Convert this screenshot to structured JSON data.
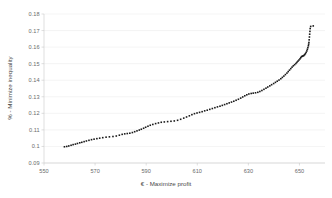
{
  "chart_data": {
    "type": "scatter",
    "title": "",
    "xlabel": "€ - Maximize profit",
    "ylabel": "% - Minimize inequality",
    "xlim": [
      550,
      660
    ],
    "ylim": [
      0.09,
      0.18
    ],
    "xticks": [
      550,
      570,
      590,
      610,
      630,
      650
    ],
    "yticks": [
      0.09,
      0.1,
      0.11,
      0.12,
      0.13,
      0.14,
      0.15,
      0.16,
      0.17,
      0.18
    ],
    "xtick_labels": [
      "550",
      "570",
      "590",
      "610",
      "630",
      "650"
    ],
    "ytick_labels": [
      "0.09",
      "0.1",
      "0.11",
      "0.12",
      "0.13",
      "0.14",
      "0.15",
      "0.16",
      "0.17",
      "0.18"
    ],
    "grid": "horizontal",
    "legend": "none",
    "marker_color": "#1a1a1a",
    "marker_size": 1.6,
    "series": [
      {
        "name": "Pareto front",
        "points": [
          [
            558.0,
            0.0998
          ],
          [
            558.9,
            0.1
          ],
          [
            559.7,
            0.1003
          ],
          [
            560.6,
            0.1007
          ],
          [
            561.4,
            0.1011
          ],
          [
            562.3,
            0.1014
          ],
          [
            563.1,
            0.1018
          ],
          [
            564.0,
            0.1022
          ],
          [
            564.8,
            0.1025
          ],
          [
            565.7,
            0.1029
          ],
          [
            566.6,
            0.1033
          ],
          [
            567.6,
            0.1037
          ],
          [
            568.6,
            0.1041
          ],
          [
            569.6,
            0.1044
          ],
          [
            570.7,
            0.1047
          ],
          [
            571.8,
            0.105
          ],
          [
            573.0,
            0.1053
          ],
          [
            574.3,
            0.1056
          ],
          [
            575.6,
            0.1058
          ],
          [
            577.0,
            0.106
          ],
          [
            578.3,
            0.1063
          ],
          [
            579.5,
            0.1068
          ],
          [
            580.6,
            0.1073
          ],
          [
            581.6,
            0.1076
          ],
          [
            582.6,
            0.1078
          ],
          [
            583.6,
            0.108
          ],
          [
            584.6,
            0.1084
          ],
          [
            585.5,
            0.1089
          ],
          [
            586.4,
            0.1094
          ],
          [
            587.3,
            0.1099
          ],
          [
            588.1,
            0.1104
          ],
          [
            589.0,
            0.111
          ],
          [
            589.8,
            0.1116
          ],
          [
            590.7,
            0.1122
          ],
          [
            591.6,
            0.1128
          ],
          [
            592.6,
            0.1133
          ],
          [
            593.7,
            0.1138
          ],
          [
            594.8,
            0.1142
          ],
          [
            595.9,
            0.1146
          ],
          [
            597.1,
            0.1148
          ],
          [
            598.4,
            0.115
          ],
          [
            599.7,
            0.1152
          ],
          [
            601.0,
            0.1154
          ],
          [
            602.3,
            0.1158
          ],
          [
            603.5,
            0.1164
          ],
          [
            604.7,
            0.1171
          ],
          [
            605.8,
            0.1178
          ],
          [
            606.9,
            0.1185
          ],
          [
            607.9,
            0.1192
          ],
          [
            608.9,
            0.1198
          ],
          [
            609.9,
            0.1202
          ],
          [
            610.9,
            0.1206
          ],
          [
            611.9,
            0.121
          ],
          [
            612.9,
            0.1215
          ],
          [
            613.9,
            0.1219
          ],
          [
            614.9,
            0.1224
          ],
          [
            615.9,
            0.1229
          ],
          [
            616.9,
            0.1234
          ],
          [
            617.9,
            0.1239
          ],
          [
            618.9,
            0.1243
          ],
          [
            619.8,
            0.1248
          ],
          [
            620.7,
            0.1253
          ],
          [
            621.6,
            0.1258
          ],
          [
            622.5,
            0.1263
          ],
          [
            623.4,
            0.1268
          ],
          [
            624.3,
            0.1273
          ],
          [
            625.2,
            0.1279
          ],
          [
            626.1,
            0.1285
          ],
          [
            627.0,
            0.1292
          ],
          [
            627.8,
            0.1299
          ],
          [
            628.6,
            0.1306
          ],
          [
            629.4,
            0.1312
          ],
          [
            630.2,
            0.1317
          ],
          [
            631.1,
            0.132
          ],
          [
            631.9,
            0.1322
          ],
          [
            632.8,
            0.1324
          ],
          [
            633.7,
            0.1327
          ],
          [
            634.5,
            0.1332
          ],
          [
            635.3,
            0.1338
          ],
          [
            636.1,
            0.1345
          ],
          [
            636.9,
            0.1352
          ],
          [
            637.6,
            0.1359
          ],
          [
            638.4,
            0.1366
          ],
          [
            639.1,
            0.1373
          ],
          [
            639.9,
            0.138
          ],
          [
            640.6,
            0.1387
          ],
          [
            641.3,
            0.1394
          ],
          [
            642.0,
            0.1401
          ],
          [
            642.7,
            0.1409
          ],
          [
            643.3,
            0.1417
          ],
          [
            643.9,
            0.1425
          ],
          [
            644.5,
            0.1434
          ],
          [
            645.1,
            0.1443
          ],
          [
            645.6,
            0.1452
          ],
          [
            646.1,
            0.1461
          ],
          [
            646.6,
            0.147
          ],
          [
            647.1,
            0.1479
          ],
          [
            647.6,
            0.1487
          ],
          [
            648.1,
            0.1494
          ],
          [
            648.6,
            0.1501
          ],
          [
            649.0,
            0.1508
          ],
          [
            649.4,
            0.1515
          ],
          [
            649.8,
            0.1522
          ],
          [
            650.2,
            0.1529
          ],
          [
            650.5,
            0.1536
          ],
          [
            650.8,
            0.1542
          ],
          [
            651.1,
            0.1545
          ],
          [
            651.4,
            0.1547
          ],
          [
            651.7,
            0.1549
          ],
          [
            652.0,
            0.1554
          ],
          [
            652.3,
            0.156
          ],
          [
            652.6,
            0.1568
          ],
          [
            652.9,
            0.1577
          ],
          [
            653.1,
            0.1587
          ],
          [
            653.3,
            0.1597
          ],
          [
            653.5,
            0.1608
          ],
          [
            653.6,
            0.1618
          ],
          [
            653.7,
            0.1628
          ],
          [
            653.8,
            0.1644
          ],
          [
            653.9,
            0.1661
          ],
          [
            654.0,
            0.1678
          ],
          [
            654.1,
            0.1695
          ],
          [
            654.2,
            0.1712
          ],
          [
            654.4,
            0.1725
          ],
          [
            655.4,
            0.1728
          ]
        ]
      }
    ]
  }
}
